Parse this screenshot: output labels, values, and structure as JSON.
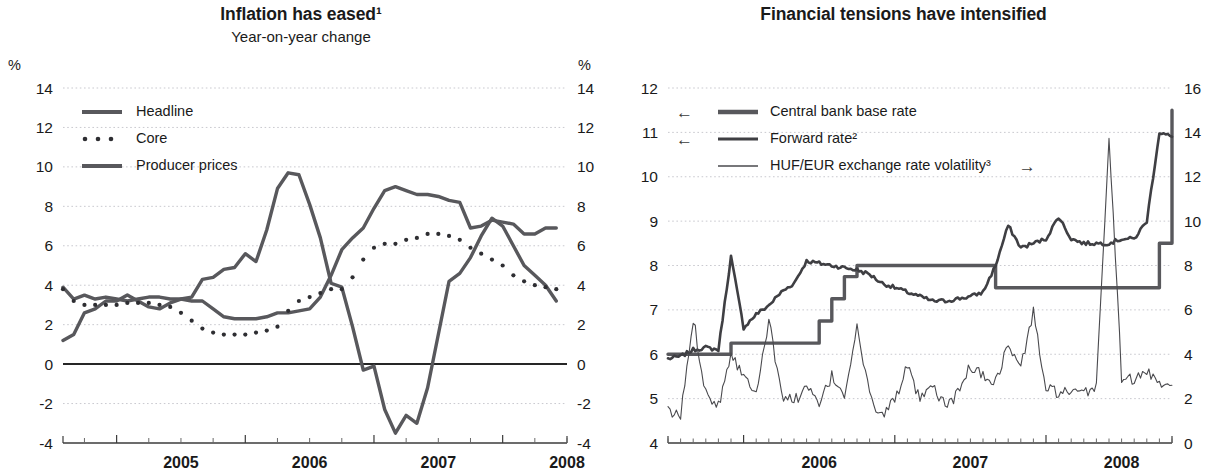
{
  "left": {
    "title": "Inflation has eased¹",
    "subtitle": "Year-on-year change",
    "unit_left": "%",
    "unit_right": "%",
    "legend": [
      {
        "label": "Headline",
        "style": "thick-line",
        "color": "#58585c"
      },
      {
        "label": "Core",
        "style": "dotted-line",
        "color": "#2e2e32"
      },
      {
        "label": "Producer prices",
        "style": "thick-line",
        "color": "#58585c"
      }
    ],
    "chart_data": {
      "type": "line",
      "title": "Inflation has eased¹",
      "subtitle": "Year-on-year change",
      "xlabel": "",
      "ylabel": "%",
      "ylim": [
        -4,
        14
      ],
      "yticks": [
        -4,
        -2,
        0,
        2,
        4,
        6,
        8,
        10,
        12,
        14
      ],
      "y2lim": [
        -4,
        14
      ],
      "y2ticks": [
        -4,
        -2,
        0,
        2,
        4,
        6,
        8,
        10,
        12,
        14
      ],
      "xlim": [
        "2004-08",
        "2008-07"
      ],
      "xticks": [
        "2005",
        "2006",
        "2007",
        "2008"
      ],
      "grid": true,
      "legend_position": "top-left",
      "series": [
        {
          "name": "Headline",
          "x": [
            "2004-08",
            "2004-09",
            "2004-10",
            "2004-11",
            "2004-12",
            "2005-01",
            "2005-02",
            "2005-03",
            "2005-04",
            "2005-05",
            "2005-06",
            "2005-07",
            "2005-08",
            "2005-09",
            "2005-10",
            "2005-11",
            "2005-12",
            "2006-01",
            "2006-02",
            "2006-03",
            "2006-04",
            "2006-05",
            "2006-06",
            "2006-07",
            "2006-08",
            "2006-09",
            "2006-10",
            "2006-11",
            "2006-12",
            "2007-01",
            "2007-02",
            "2007-03",
            "2007-04",
            "2007-05",
            "2007-06",
            "2007-07",
            "2007-08",
            "2007-09",
            "2007-10",
            "2007-11",
            "2007-12",
            "2008-01",
            "2008-02",
            "2008-03",
            "2008-04",
            "2008-05",
            "2008-06"
          ],
          "values": [
            3.9,
            3.3,
            3.5,
            3.3,
            3.4,
            3.3,
            3.2,
            3.3,
            3.4,
            3.4,
            3.3,
            3.3,
            3.2,
            3.2,
            2.8,
            2.4,
            2.3,
            2.3,
            2.3,
            2.4,
            2.6,
            2.6,
            2.7,
            2.8,
            3.4,
            4.5,
            5.8,
            6.4,
            6.9,
            7.9,
            8.8,
            9.0,
            8.8,
            8.6,
            8.6,
            8.5,
            8.3,
            8.2,
            6.9,
            7.0,
            7.3,
            7.2,
            7.1,
            6.6,
            6.6,
            6.9,
            6.9,
            6.8,
            6.7,
            6.3,
            5.8
          ]
        },
        {
          "name": "Core",
          "x": [
            "2004-08",
            "2004-09",
            "2004-10",
            "2004-11",
            "2004-12",
            "2005-01",
            "2005-02",
            "2005-03",
            "2005-04",
            "2005-05",
            "2005-06",
            "2005-07",
            "2005-08",
            "2005-09",
            "2005-10",
            "2005-11",
            "2005-12",
            "2006-01",
            "2006-02",
            "2006-03",
            "2006-04",
            "2006-05",
            "2006-06",
            "2006-07",
            "2006-08",
            "2006-09",
            "2006-10",
            "2006-11",
            "2006-12",
            "2007-01",
            "2007-02",
            "2007-03",
            "2007-04",
            "2007-05",
            "2007-06",
            "2007-07",
            "2007-08",
            "2007-09",
            "2007-10",
            "2007-11",
            "2007-12",
            "2008-01",
            "2008-02",
            "2008-03",
            "2008-04",
            "2008-05",
            "2008-06"
          ],
          "values": [
            3.8,
            3.2,
            3.0,
            3.0,
            3.0,
            3.0,
            3.1,
            3.1,
            3.1,
            3.0,
            2.9,
            2.6,
            2.2,
            1.8,
            1.6,
            1.5,
            1.5,
            1.5,
            1.6,
            1.7,
            1.9,
            2.7,
            3.2,
            3.4,
            3.6,
            3.8,
            3.8,
            4.4,
            5.3,
            5.9,
            6.1,
            6.1,
            6.3,
            6.4,
            6.6,
            6.6,
            6.5,
            6.3,
            5.9,
            5.6,
            5.3,
            5.0,
            4.5,
            4.2,
            4.0,
            3.9,
            3.8,
            3.7,
            3.6,
            3.3,
            3.2
          ]
        },
        {
          "name": "Producer prices",
          "x": [
            "2004-08",
            "2004-09",
            "2004-10",
            "2004-11",
            "2004-12",
            "2005-01",
            "2005-02",
            "2005-03",
            "2005-04",
            "2005-05",
            "2005-06",
            "2005-07",
            "2005-08",
            "2005-09",
            "2005-10",
            "2005-11",
            "2005-12",
            "2006-01",
            "2006-02",
            "2006-03",
            "2006-04",
            "2006-05",
            "2006-06",
            "2006-07",
            "2006-08",
            "2006-09",
            "2006-10",
            "2006-11",
            "2006-12",
            "2007-01",
            "2007-02",
            "2007-03",
            "2007-04",
            "2007-05",
            "2007-06",
            "2007-07",
            "2007-08",
            "2007-09",
            "2007-10",
            "2007-11",
            "2007-12",
            "2008-01",
            "2008-02",
            "2008-03",
            "2008-04",
            "2008-05",
            "2008-06"
          ],
          "values": [
            1.2,
            1.5,
            2.6,
            2.8,
            3.2,
            3.2,
            3.5,
            3.2,
            2.9,
            2.8,
            3.1,
            3.3,
            3.4,
            4.3,
            4.4,
            4.8,
            4.9,
            5.6,
            5.2,
            6.8,
            8.9,
            9.7,
            9.6,
            8.1,
            6.4,
            4.1,
            3.9,
            1.9,
            -0.3,
            -0.1,
            -2.3,
            -3.5,
            -2.6,
            -3.0,
            -1.2,
            1.5,
            4.2,
            4.6,
            5.4,
            6.5,
            7.4,
            7.0,
            6.0,
            5.0,
            4.5,
            4.0,
            3.2
          ]
        }
      ]
    }
  },
  "right": {
    "title": "Financial tensions have intensified",
    "unit_left": "%",
    "unit_right": "%",
    "legend": [
      {
        "label": "Central bank base rate",
        "style": "thick-line",
        "arrow": "←",
        "axis": "left",
        "color": "#58585c"
      },
      {
        "label": "Forward rate²",
        "style": "medium-line",
        "arrow": "←",
        "axis": "left",
        "color": "#3f3f43"
      },
      {
        "label": "HUF/EUR exchange rate volatility³",
        "style": "thin-line",
        "arrow": "→",
        "axis": "right",
        "color": "#4a4a4e"
      }
    ],
    "chart_data": {
      "type": "line",
      "title": "Financial tensions have intensified",
      "xlabel": "",
      "ylabel": "%",
      "ylim": [
        4,
        12
      ],
      "yticks": [
        4,
        5,
        6,
        7,
        8,
        9,
        10,
        11,
        12
      ],
      "y2lim": [
        0,
        16
      ],
      "y2ticks": [
        0,
        2,
        4,
        6,
        8,
        10,
        12,
        14,
        16
      ],
      "xlim": [
        "2005-07",
        "2008-11"
      ],
      "xticks": [
        "2006",
        "2007",
        "2008"
      ],
      "grid": true,
      "legend_position": "top-left",
      "series": [
        {
          "name": "Central bank base rate",
          "axis": "left",
          "step": true,
          "x": [
            "2005-07",
            "2005-09",
            "2005-12",
            "2006-06",
            "2006-07",
            "2006-08",
            "2006-09",
            "2006-10",
            "2007-06",
            "2007-09",
            "2008-04",
            "2008-10",
            "2008-11"
          ],
          "values": [
            6.0,
            6.0,
            6.25,
            6.25,
            6.75,
            7.25,
            7.75,
            8.0,
            8.0,
            7.5,
            7.5,
            8.5,
            11.5
          ]
        },
        {
          "name": "Forward rate²",
          "axis": "left",
          "x": [
            "2005-07",
            "2005-08",
            "2005-09",
            "2005-10",
            "2005-11",
            "2005-12",
            "2006-01",
            "2006-02",
            "2006-03",
            "2006-04",
            "2006-05",
            "2006-06",
            "2006-07",
            "2006-08",
            "2006-09",
            "2006-10",
            "2006-11",
            "2006-12",
            "2007-01",
            "2007-02",
            "2007-03",
            "2007-04",
            "2007-05",
            "2007-06",
            "2007-07",
            "2007-08",
            "2007-09",
            "2007-10",
            "2007-11",
            "2007-12",
            "2008-01",
            "2008-02",
            "2008-03",
            "2008-04",
            "2008-05",
            "2008-06",
            "2008-07",
            "2008-08",
            "2008-09",
            "2008-10",
            "2008-11"
          ],
          "values": [
            5.9,
            5.95,
            6.1,
            6.15,
            6.1,
            8.2,
            6.6,
            6.9,
            7.1,
            7.4,
            7.6,
            8.1,
            8.05,
            8.0,
            7.95,
            7.9,
            7.8,
            7.6,
            7.5,
            7.4,
            7.3,
            7.2,
            7.2,
            7.25,
            7.3,
            7.4,
            8.0,
            8.9,
            8.4,
            8.5,
            8.6,
            9.1,
            8.6,
            8.5,
            8.5,
            8.5,
            8.6,
            8.6,
            9.0,
            11.0,
            10.9
          ]
        },
        {
          "name": "HUF/EUR exchange rate volatility³",
          "axis": "right",
          "x": [
            "2005-07",
            "2005-08",
            "2005-09",
            "2005-10",
            "2005-11",
            "2005-12",
            "2006-01",
            "2006-02",
            "2006-03",
            "2006-04",
            "2006-05",
            "2006-06",
            "2006-07",
            "2006-08",
            "2006-09",
            "2006-10",
            "2006-11",
            "2006-12",
            "2007-01",
            "2007-02",
            "2007-03",
            "2007-04",
            "2007-05",
            "2007-06",
            "2007-07",
            "2007-08",
            "2007-09",
            "2007-10",
            "2007-11",
            "2007-12",
            "2008-01",
            "2008-02",
            "2008-03",
            "2008-04",
            "2008-05",
            "2008-06",
            "2008-07",
            "2008-08",
            "2008-09",
            "2008-10",
            "2008-11"
          ],
          "values": [
            1.4,
            1.2,
            5.6,
            2.3,
            1.7,
            4.1,
            3.0,
            2.4,
            5.5,
            2.2,
            1.9,
            2.5,
            1.7,
            3.0,
            2.2,
            5.2,
            2.1,
            1.2,
            2.0,
            3.4,
            1.9,
            2.5,
            1.7,
            2.2,
            3.5,
            3.0,
            2.8,
            4.4,
            3.4,
            5.9,
            2.4,
            2.3,
            2.2,
            2.2,
            2.6,
            13.8,
            3.0,
            2.8,
            3.2,
            2.8,
            2.6
          ]
        }
      ]
    }
  }
}
